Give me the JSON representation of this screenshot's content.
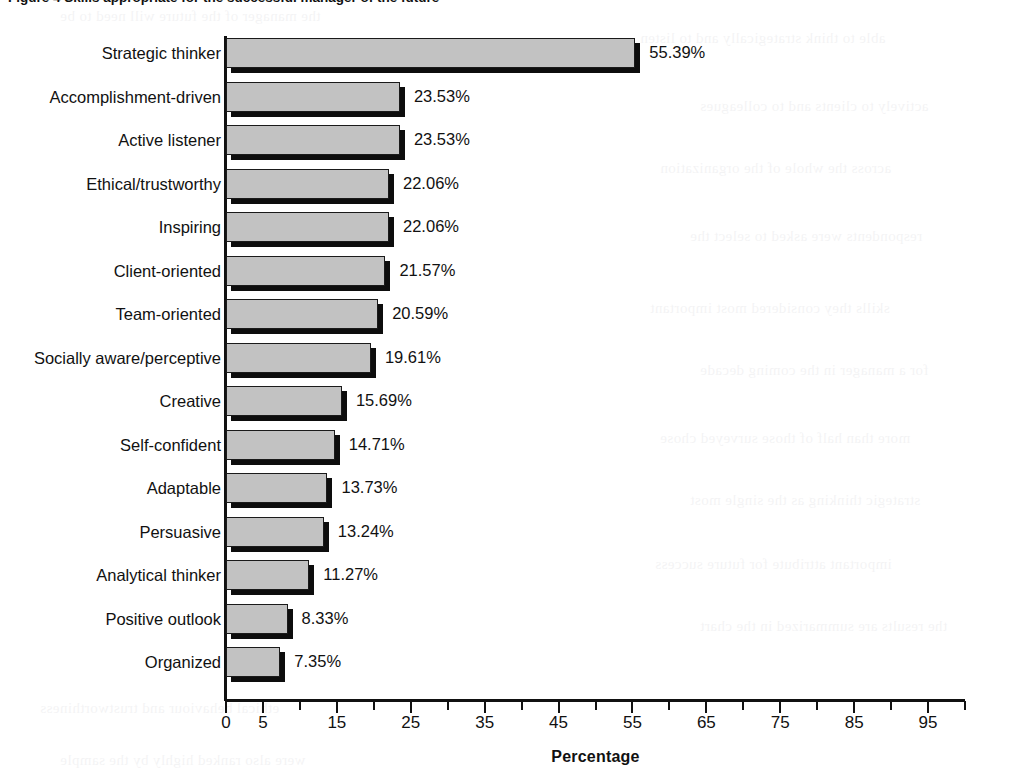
{
  "figure": {
    "caption": "Figure 4  Skills appropriate for the successful manager of the future",
    "caption_visible_fragment": "Figure 4  Skills appropriate for the successful manager of the future"
  },
  "chart_data": {
    "type": "bar",
    "orientation": "horizontal",
    "title": "",
    "xlabel": "Percentage",
    "ylabel": "",
    "xlim": [
      0,
      100
    ],
    "grid": false,
    "legend": "none",
    "tick_step": 5,
    "tick_labels_shown": [
      "0",
      "5",
      "15",
      "25",
      "35",
      "45",
      "55",
      "65",
      "75",
      "85",
      "95"
    ],
    "value_suffix": "%",
    "categories": [
      "Strategic thinker",
      "Accomplishment-driven",
      "Active listener",
      "Ethical/trustworthy",
      "Inspiring",
      "Client-oriented",
      "Team-oriented",
      "Socially aware/perceptive",
      "Creative",
      "Self-confident",
      "Adaptable",
      "Persuasive",
      "Analytical thinker",
      "Positive outlook",
      "Organized"
    ],
    "values": [
      55.39,
      23.53,
      23.53,
      22.06,
      22.06,
      21.57,
      20.59,
      19.61,
      15.69,
      14.71,
      13.73,
      13.24,
      11.27,
      8.33,
      7.35
    ],
    "value_labels": [
      "55.39%",
      "23.53%",
      "23.53%",
      "22.06%",
      "22.06%",
      "21.57%",
      "20.59%",
      "19.61%",
      "15.69%",
      "14.71%",
      "13.73%",
      "13.24%",
      "11.27%",
      "8.33%",
      "7.35%"
    ],
    "colors": {
      "bar_fill": "#c2c2c2",
      "bar_outline": "#1a1a1a",
      "bar_shadow": "#0d0d0d",
      "axis": "#111111",
      "text": "#111111",
      "background": "#ffffff"
    }
  },
  "bleed_through": [
    "the manager of the future will need to be",
    "able to think strategically and to listen",
    "actively to clients and to colleagues",
    "across the whole of the organization",
    "respondents were asked to select the",
    "skills they considered most important",
    "for a manager in the coming decade",
    "more than half of those surveyed chose",
    "strategic thinking as the single most",
    "important attribute for future success",
    "the results are summarized in the chart",
    "ethical behaviour and trustworthiness",
    "were also ranked highly by the sample"
  ]
}
